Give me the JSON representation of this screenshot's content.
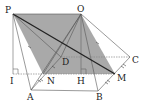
{
  "figure": {
    "labels": {
      "P": "P",
      "O": "O",
      "C": "C",
      "D": "D",
      "I": "I",
      "N": "N",
      "H": "H",
      "M": "M",
      "A": "A",
      "B": "B"
    },
    "colors": {
      "shade": "#a6a6a6",
      "line": "#555555",
      "bold_line": "#222222",
      "dotted": "#888888"
    }
  }
}
